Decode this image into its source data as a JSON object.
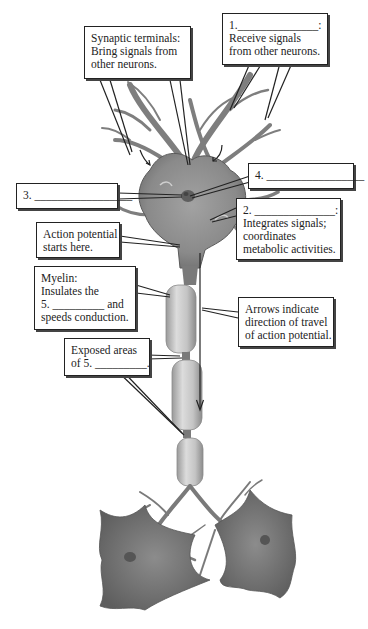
{
  "diagram": {
    "subject": "Neuron",
    "colors": {
      "cell_body": "#8a8a8a",
      "myelin": "#c8c8c8",
      "outline": "#222222",
      "background": "#ffffff"
    },
    "callouts": {
      "synaptic_terminals": {
        "lines": [
          "Synaptic terminals:",
          "Bring signals from",
          "other neurons."
        ]
      },
      "label_1": {
        "number": "1.",
        "blank": "______________",
        "suffix": ":",
        "lines": [
          "Receive signals",
          "from other neurons."
        ]
      },
      "label_4": {
        "number": "4.",
        "blank": "_________________"
      },
      "label_3": {
        "number": "3.",
        "blank": "_________________"
      },
      "label_2": {
        "number": "2.",
        "blank": "______________",
        "suffix": ":",
        "lines": [
          "Integrates signals;",
          "coordinates",
          "metabolic activities."
        ]
      },
      "action_potential": {
        "lines": [
          "Action potential",
          "starts here."
        ]
      },
      "myelin": {
        "lines": [
          "Myelin:",
          "Insulates the"
        ],
        "line3_prefix": "5.",
        "line3_blank": "_________",
        "line3_suffix": "and",
        "line4": "speeds conduction."
      },
      "arrows": {
        "lines": [
          "Arrows indicate",
          "direction of travel",
          "of action potential."
        ]
      },
      "exposed_areas": {
        "line1": "Exposed areas",
        "line2_prefix": "of 5.",
        "line2_blank": "_________",
        "line2_suffix": "."
      }
    },
    "parts_depicted": [
      "dendrites",
      "cell body",
      "nucleus",
      "axon hillock",
      "axon",
      "myelin sheath",
      "nodes of Ranvier",
      "axon terminals",
      "postsynaptic neurons"
    ]
  }
}
